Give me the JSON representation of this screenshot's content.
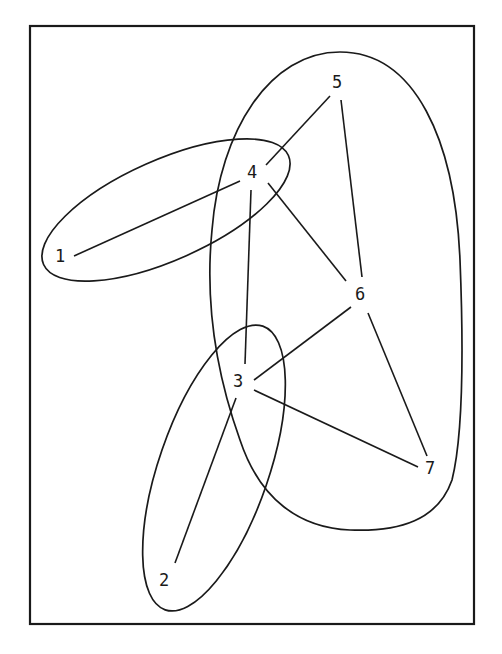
{
  "diagram": {
    "type": "hypergraph",
    "stroke_color": "#1a1a1a",
    "background": "#ffffff",
    "nodes": [
      {
        "id": "1",
        "label": "1",
        "x": 60,
        "y": 256
      },
      {
        "id": "2",
        "label": "2",
        "x": 164,
        "y": 580
      },
      {
        "id": "3",
        "label": "3",
        "x": 238,
        "y": 381
      },
      {
        "id": "4",
        "label": "4",
        "x": 252,
        "y": 172
      },
      {
        "id": "5",
        "label": "5",
        "x": 337,
        "y": 82
      },
      {
        "id": "6",
        "label": "6",
        "x": 360,
        "y": 294
      },
      {
        "id": "7",
        "label": "7",
        "x": 430,
        "y": 468
      }
    ],
    "edges": [
      {
        "from": "1",
        "to": "4"
      },
      {
        "from": "4",
        "to": "5"
      },
      {
        "from": "4",
        "to": "6"
      },
      {
        "from": "4",
        "to": "3"
      },
      {
        "from": "5",
        "to": "6"
      },
      {
        "from": "6",
        "to": "3"
      },
      {
        "from": "6",
        "to": "7"
      },
      {
        "from": "3",
        "to": "7"
      },
      {
        "from": "3",
        "to": "2"
      }
    ],
    "hyperedges": [
      {
        "name": "hyperedge-1-4",
        "members": [
          "1",
          "4"
        ]
      },
      {
        "name": "hyperedge-2-3",
        "members": [
          "2",
          "3"
        ]
      },
      {
        "name": "hyperedge-3-4-5-6-7",
        "members": [
          "3",
          "4",
          "5",
          "6",
          "7"
        ]
      }
    ]
  }
}
